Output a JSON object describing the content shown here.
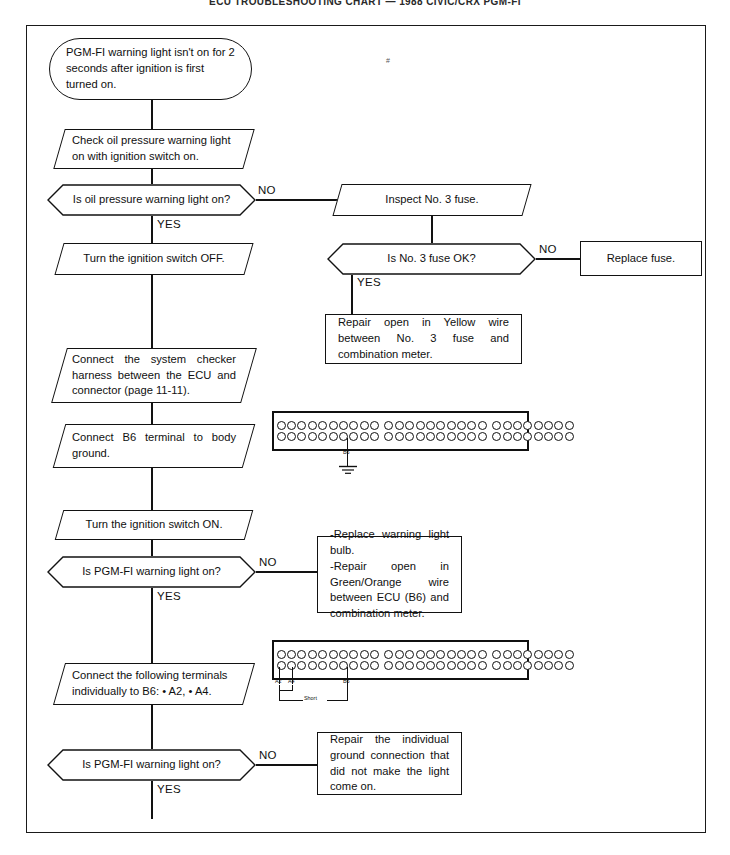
{
  "document": {
    "title": "ECU TROUBLESHOOTING CHART — 1988 CIVIC/CRX PGM-FI",
    "page_mark": "#"
  },
  "labels": {
    "yes": "YES",
    "no": "NO"
  },
  "flow": {
    "start": {
      "id": "start-terminator",
      "text": "PGM-FI warning light isn't on for 2 seconds after ignition is first turned on."
    },
    "steps": [
      {
        "id": "check-oil-pressure-light",
        "shape": "parallelogram",
        "text": "Check oil pressure warning light on with ignition switch on."
      },
      {
        "id": "turn-ignition-off",
        "shape": "parallelogram",
        "text": "Turn the ignition switch OFF."
      },
      {
        "id": "connect-system-checker",
        "shape": "parallelogram",
        "text": "Connect the system checker harness between the ECU and connector (page 11-11)."
      },
      {
        "id": "connect-b6-ground",
        "shape": "parallelogram",
        "text": "Connect B6 terminal to body ground."
      },
      {
        "id": "turn-ignition-on",
        "shape": "parallelogram",
        "text": "Turn the ignition switch ON."
      },
      {
        "id": "connect-terminals-individually",
        "shape": "parallelogram",
        "text": "Connect the following terminals individually to B6: • A2, •  A4."
      },
      {
        "id": "inspect-no3-fuse",
        "shape": "parallelogram",
        "text": "Inspect No. 3 fuse."
      }
    ],
    "decisions": [
      {
        "id": "decision-oil-pressure-light",
        "text": "Is oil pressure warning light on?",
        "yes": "YES",
        "no": "NO"
      },
      {
        "id": "decision-no3-fuse-ok",
        "text": "Is No. 3 fuse OK?",
        "yes": "YES",
        "no": "NO"
      },
      {
        "id": "decision-pgmfi-light-1",
        "text": "Is PGM-FI warning light on?",
        "yes": "YES",
        "no": "NO"
      },
      {
        "id": "decision-pgmfi-light-2",
        "text": "Is PGM-FI warning light on?",
        "yes": "YES",
        "no": "NO"
      }
    ],
    "results": [
      {
        "id": "result-replace-fuse",
        "text": "Replace fuse."
      },
      {
        "id": "result-repair-yellow-wire",
        "text": "Repair open in Yellow wire between No. 3 fuse and combination meter."
      },
      {
        "id": "result-replace-bulb-repair-green-orange",
        "text": "-Replace warning light bulb.\n-Repair open in Green/Orange wire between ECU (B6) and combination meter."
      },
      {
        "id": "result-repair-ground-connection",
        "text": "Repair the individual ground connection that did not make the light come on."
      }
    ]
  },
  "connectors": [
    {
      "id": "connector-diagram-b6-ground",
      "blocks": [
        {
          "name": "block-a",
          "columns": 10,
          "rows": 2
        },
        {
          "name": "block-b",
          "columns": 10,
          "rows": 2
        },
        {
          "name": "block-c",
          "columns": 8,
          "rows": 2
        }
      ],
      "pin_labels": [
        {
          "name": "B6",
          "text": "B6"
        }
      ],
      "ground_symbol": true
    },
    {
      "id": "connector-diagram-a2-a4-short",
      "blocks": [
        {
          "name": "block-a",
          "columns": 10,
          "rows": 2
        },
        {
          "name": "block-b",
          "columns": 10,
          "rows": 2
        },
        {
          "name": "block-c",
          "columns": 8,
          "rows": 2
        }
      ],
      "pin_labels": [
        {
          "name": "A2",
          "text": "A2"
        },
        {
          "name": "A4",
          "text": "A4"
        },
        {
          "name": "B6",
          "text": "B6"
        }
      ],
      "bracket_label": "Short",
      "ground_symbol": false
    }
  ],
  "colors": {
    "ink": "#101010",
    "paper": "#ffffff"
  }
}
